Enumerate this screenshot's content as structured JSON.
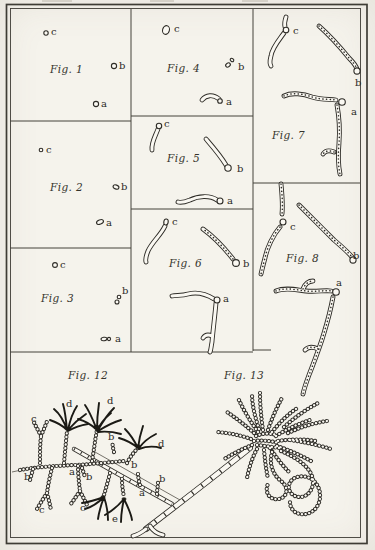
{
  "plate": {
    "paper_color": "#f5f3ec",
    "ink_color": "#2e2c27",
    "description": "Botanical plate of fungal spores, germination stages and hyphae"
  },
  "figures": {
    "fig1": {
      "label": "Fig. 1",
      "letters": {
        "a": "a",
        "b": "b",
        "c": "c"
      }
    },
    "fig2": {
      "label": "Fig. 2",
      "letters": {
        "a": "a",
        "b": "b",
        "c": "c"
      }
    },
    "fig3": {
      "label": "Fig. 3",
      "letters": {
        "a": "a",
        "b": "b",
        "c": "c"
      }
    },
    "fig4": {
      "label": "Fig. 4",
      "letters": {
        "a": "a",
        "b": "b",
        "c": "c"
      }
    },
    "fig5": {
      "label": "Fig. 5",
      "letters": {
        "a": "a",
        "b": "b",
        "c": "c"
      }
    },
    "fig6": {
      "label": "Fig. 6",
      "letters": {
        "a": "a",
        "b": "b",
        "c": "c"
      }
    },
    "fig7": {
      "label": "Fig. 7",
      "letters": {
        "a": "a",
        "b": "b",
        "c": "c"
      }
    },
    "fig8": {
      "label": "Fig. 8",
      "letters": {
        "a": "a",
        "b": "b",
        "c": "c"
      }
    },
    "fig12": {
      "label": "Fig. 12",
      "letters": {
        "a": "a",
        "b": "b",
        "c": "c",
        "d": "d",
        "e": "e"
      }
    },
    "fig13": {
      "label": "Fig. 13"
    }
  }
}
